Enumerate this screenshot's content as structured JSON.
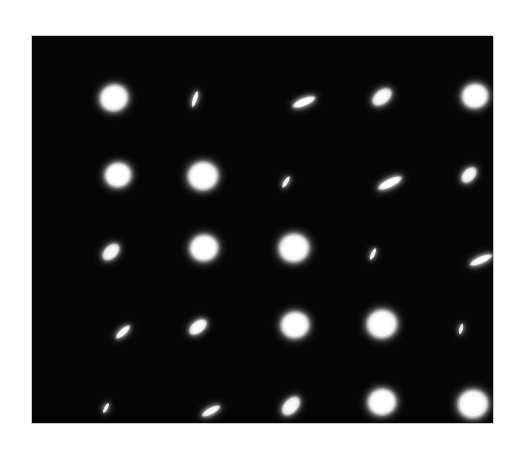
{
  "page": {
    "background_color": "#ffffff"
  },
  "panel": {
    "name": "psf-image-panel",
    "x": 32,
    "y": 36,
    "width": 461,
    "height": 387,
    "background_color": "#050505",
    "border_color": "#c8c8c8"
  },
  "chart_data": {
    "type": "scatter",
    "subtitle": "",
    "xlabel": "",
    "ylabel": "",
    "grid": false,
    "legend": false,
    "background_color": "#050505",
    "spot_color": "#ffffff",
    "rows": 5,
    "cols": 5,
    "field_width": 461,
    "field_height": 387,
    "spots": [
      {
        "id": "r1c1",
        "row": 1,
        "col": 1,
        "cx": 82,
        "cy": 62,
        "rx": 15,
        "ry": 14,
        "angle": -20,
        "intensity": 1.0,
        "shape": "round"
      },
      {
        "id": "r1c2",
        "row": 1,
        "col": 2,
        "cx": 163,
        "cy": 63,
        "rx": 9,
        "ry": 2.4,
        "angle": -72,
        "intensity": 0.92,
        "shape": "sliver"
      },
      {
        "id": "r1c3",
        "row": 1,
        "col": 3,
        "cx": 272,
        "cy": 66,
        "rx": 13,
        "ry": 4.2,
        "angle": -22,
        "intensity": 0.95,
        "shape": "ellipse"
      },
      {
        "id": "r1c4",
        "row": 1,
        "col": 4,
        "cx": 350,
        "cy": 61,
        "rx": 12,
        "ry": 7.5,
        "angle": -38,
        "intensity": 0.82,
        "shape": "ellipse"
      },
      {
        "id": "r1c5",
        "row": 1,
        "col": 5,
        "cx": 443,
        "cy": 60,
        "rx": 14,
        "ry": 13,
        "angle": -10,
        "intensity": 1.0,
        "shape": "round"
      },
      {
        "id": "r2c1",
        "row": 2,
        "col": 1,
        "cx": 86,
        "cy": 139,
        "rx": 14,
        "ry": 13,
        "angle": -15,
        "intensity": 1.0,
        "shape": "round"
      },
      {
        "id": "r2c2",
        "row": 2,
        "col": 2,
        "cx": 171,
        "cy": 140,
        "rx": 16,
        "ry": 15,
        "angle": -10,
        "intensity": 1.0,
        "shape": "round"
      },
      {
        "id": "r2c3",
        "row": 2,
        "col": 3,
        "cx": 254,
        "cy": 146,
        "rx": 7,
        "ry": 2.3,
        "angle": -58,
        "intensity": 0.9,
        "shape": "sliver"
      },
      {
        "id": "r2c4",
        "row": 2,
        "col": 4,
        "cx": 358,
        "cy": 147,
        "rx": 14,
        "ry": 4.5,
        "angle": -26,
        "intensity": 0.95,
        "shape": "ellipse"
      },
      {
        "id": "r2c5",
        "row": 2,
        "col": 5,
        "cx": 437,
        "cy": 139,
        "rx": 10,
        "ry": 6.5,
        "angle": -48,
        "intensity": 0.8,
        "shape": "ellipse"
      },
      {
        "id": "r3c1",
        "row": 3,
        "col": 1,
        "cx": 79,
        "cy": 216,
        "rx": 11,
        "ry": 7,
        "angle": -44,
        "intensity": 0.78,
        "shape": "ellipse"
      },
      {
        "id": "r3c2",
        "row": 3,
        "col": 2,
        "cx": 172,
        "cy": 212,
        "rx": 15,
        "ry": 14,
        "angle": -10,
        "intensity": 1.0,
        "shape": "round"
      },
      {
        "id": "r3c3",
        "row": 3,
        "col": 3,
        "cx": 262,
        "cy": 212,
        "rx": 16,
        "ry": 15,
        "angle": -10,
        "intensity": 1.0,
        "shape": "round"
      },
      {
        "id": "r3c4",
        "row": 3,
        "col": 4,
        "cx": 341,
        "cy": 218,
        "rx": 7,
        "ry": 2.2,
        "angle": -65,
        "intensity": 0.88,
        "shape": "sliver"
      },
      {
        "id": "r3c5",
        "row": 3,
        "col": 5,
        "cx": 449,
        "cy": 224,
        "rx": 13,
        "ry": 3.8,
        "angle": -24,
        "intensity": 0.92,
        "shape": "ellipse"
      },
      {
        "id": "r4c1",
        "row": 4,
        "col": 1,
        "cx": 91,
        "cy": 296,
        "rx": 10,
        "ry": 3.4,
        "angle": -42,
        "intensity": 0.9,
        "shape": "sliver"
      },
      {
        "id": "r4c2",
        "row": 4,
        "col": 2,
        "cx": 166,
        "cy": 291,
        "rx": 11,
        "ry": 6.5,
        "angle": -38,
        "intensity": 0.85,
        "shape": "ellipse"
      },
      {
        "id": "r4c3",
        "row": 4,
        "col": 3,
        "cx": 263,
        "cy": 289,
        "rx": 15,
        "ry": 14,
        "angle": -10,
        "intensity": 1.0,
        "shape": "round"
      },
      {
        "id": "r4c4",
        "row": 4,
        "col": 4,
        "cx": 350,
        "cy": 288,
        "rx": 16,
        "ry": 15,
        "angle": -10,
        "intensity": 1.0,
        "shape": "round"
      },
      {
        "id": "r4c5",
        "row": 4,
        "col": 5,
        "cx": 429,
        "cy": 293,
        "rx": 6,
        "ry": 2.0,
        "angle": -76,
        "intensity": 0.88,
        "shape": "sliver"
      },
      {
        "id": "r5c1",
        "row": 5,
        "col": 1,
        "cx": 74,
        "cy": 372,
        "rx": 6,
        "ry": 2.0,
        "angle": -62,
        "intensity": 0.88,
        "shape": "sliver"
      },
      {
        "id": "r5c2",
        "row": 5,
        "col": 2,
        "cx": 179,
        "cy": 375,
        "rx": 11,
        "ry": 3.6,
        "angle": -28,
        "intensity": 0.9,
        "shape": "sliver"
      },
      {
        "id": "r5c3",
        "row": 5,
        "col": 3,
        "cx": 259,
        "cy": 370,
        "rx": 12,
        "ry": 7.5,
        "angle": -47,
        "intensity": 0.82,
        "shape": "ellipse"
      },
      {
        "id": "r5c4",
        "row": 5,
        "col": 4,
        "cx": 350,
        "cy": 366,
        "rx": 15,
        "ry": 14,
        "angle": -10,
        "intensity": 1.0,
        "shape": "round"
      },
      {
        "id": "r5c5",
        "row": 5,
        "col": 5,
        "cx": 441,
        "cy": 368,
        "rx": 16,
        "ry": 15,
        "angle": -10,
        "intensity": 1.0,
        "shape": "round"
      }
    ]
  }
}
